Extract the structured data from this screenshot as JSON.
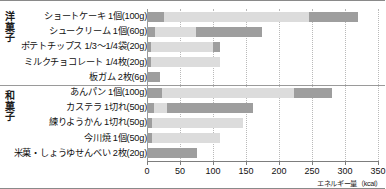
{
  "axis": {
    "unit_label": "エネルギー量（kcal）",
    "ticks": [
      0,
      50,
      100,
      150,
      200,
      250,
      300,
      350
    ],
    "min": 0,
    "max": 350
  },
  "categories": [
    {
      "id": "yogashi",
      "label": "洋\n菓\n子"
    },
    {
      "id": "wagashi",
      "label": "和\n菓\n子"
    }
  ],
  "colors": {
    "segment_dark": "#9e9e9e",
    "segment_light": "#dcdcdc",
    "axis": "#7d7d7d",
    "gridline": "#b9b9b9"
  },
  "chart_data": {
    "type": "bar",
    "title": "",
    "xlabel": "エネルギー量（kcal）",
    "ylabel": "",
    "xlim": [
      0,
      350
    ],
    "grid": true,
    "orientation": "horizontal",
    "stacked": true,
    "legend": "none",
    "categories": [
      "ショートケーキ 1個(100g)",
      "シュークリーム 1個(60g)",
      "ポテトチップス 1/3〜1/4袋(20g)",
      "ミルクチョコレート 1/4枚(20g)",
      "板ガム 2枚(6g)",
      "あんパン 1個(100g)",
      "カステラ 1切れ(50g)",
      "練りようかん 1切れ(50g)",
      "今川焼 1個(50g)",
      "米菓・しょうゆせんべい 2枚(20g)"
    ],
    "values": [
      320,
      175,
      110,
      110,
      20,
      280,
      160,
      145,
      110,
      75
    ],
    "series": [
      {
        "name": "第1区間",
        "values": [
          25,
          12,
          6,
          6,
          20,
          22,
          10,
          8,
          8,
          75
        ]
      },
      {
        "name": "第2区間",
        "values": [
          220,
          63,
          94,
          104,
          0,
          200,
          20,
          137,
          102,
          0
        ]
      },
      {
        "name": "第3区間",
        "values": [
          75,
          100,
          10,
          0,
          0,
          58,
          130,
          0,
          0,
          0
        ]
      }
    ],
    "groups": [
      {
        "name": "洋菓子",
        "rows": [
          0,
          1,
          2,
          3,
          4
        ]
      },
      {
        "name": "和菓子",
        "rows": [
          5,
          6,
          7,
          8,
          9
        ]
      }
    ]
  },
  "rows": [
    {
      "label": "ショートケーキ 1個(100g)",
      "group": "yogashi",
      "total": 320,
      "segments": [
        25,
        220,
        75
      ]
    },
    {
      "label": "シュークリーム 1個(60g)",
      "group": "yogashi",
      "total": 175,
      "segments": [
        12,
        63,
        100
      ]
    },
    {
      "label": "ポテトチップス 1/3〜1/4袋(20g)",
      "group": "yogashi",
      "total": 110,
      "segments": [
        6,
        94,
        10
      ]
    },
    {
      "label": "ミルクチョコレート 1/4枚(20g)",
      "group": "yogashi",
      "total": 110,
      "segments": [
        6,
        104,
        0
      ]
    },
    {
      "label": "板ガム 2枚(6g)",
      "group": "yogashi",
      "total": 20,
      "segments": [
        20,
        0,
        0
      ]
    },
    {
      "label": "あんパン 1個(100g)",
      "group": "wagashi",
      "total": 280,
      "segments": [
        22,
        200,
        58
      ]
    },
    {
      "label": "カステラ 1切れ(50g)",
      "group": "wagashi",
      "total": 160,
      "segments": [
        10,
        20,
        130
      ]
    },
    {
      "label": "練りようかん 1切れ(50g)",
      "group": "wagashi",
      "total": 145,
      "segments": [
        8,
        137,
        0
      ]
    },
    {
      "label": "今川焼 1個(50g)",
      "group": "wagashi",
      "total": 110,
      "segments": [
        8,
        102,
        0
      ]
    },
    {
      "label": "米菓・しょうゆせんべい 2枚(20g)",
      "group": "wagashi",
      "total": 75,
      "segments": [
        75,
        0,
        0
      ]
    }
  ]
}
